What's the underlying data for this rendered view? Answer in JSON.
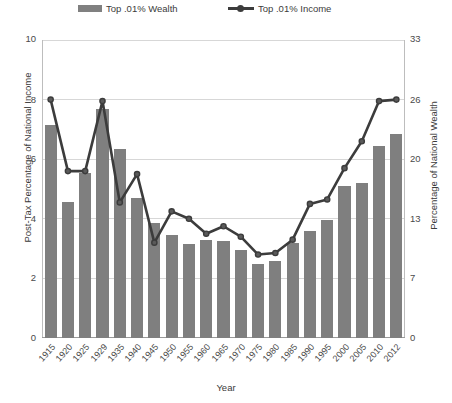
{
  "legend": {
    "entries": [
      {
        "label": "Top .01% Wealth",
        "marker": "bar-swatch",
        "color": "#808080"
      },
      {
        "label": "Top .01% Income",
        "marker": "line-marker",
        "color": "#3c3c3c"
      }
    ]
  },
  "axes": {
    "left_title": "Post-Tax Percentage of National Income",
    "right_title": "Percentage of National Wealth",
    "x_title": "Year",
    "left_ticks": [
      "0",
      "2",
      "4",
      "6",
      "8",
      "10"
    ],
    "right_ticks": [
      "0",
      "7",
      "13",
      "20",
      "26",
      "33"
    ]
  },
  "chart_data": {
    "type": "bar",
    "title": "",
    "xlabel": "Year",
    "ylabel": "Post-Tax Percentage of National Income",
    "y2label": "Percentage of National Wealth",
    "ylim": [
      0,
      10
    ],
    "y2lim": [
      0,
      33
    ],
    "yticks": [
      0,
      2,
      4,
      6,
      8,
      10
    ],
    "y2ticks": [
      0,
      7,
      13,
      20,
      26,
      33
    ],
    "grid": true,
    "legend_position": "top",
    "categories": [
      "1915",
      "1920",
      "1925",
      "1929",
      "1935",
      "1940",
      "1945",
      "1950",
      "1955",
      "1960",
      "1965",
      "1970",
      "1975",
      "1980",
      "1985",
      "1990",
      "1995",
      "2000",
      "2005",
      "2010",
      "2012"
    ],
    "series": [
      {
        "name": "Top .01% Wealth",
        "type": "bar",
        "axis": "right",
        "color": "#7f7f7f",
        "values_left_scale": [
          7.15,
          4.55,
          5.55,
          7.7,
          6.35,
          4.7,
          3.85,
          3.45,
          3.15,
          3.3,
          3.25,
          2.95,
          2.5,
          2.6,
          3.2,
          3.6,
          3.95,
          5.1,
          5.2,
          6.45,
          6.85
        ],
        "values": [
          23.6,
          15.0,
          18.3,
          25.4,
          21.0,
          15.5,
          12.7,
          11.4,
          10.4,
          10.9,
          10.7,
          9.7,
          8.3,
          8.6,
          10.6,
          11.9,
          13.0,
          16.8,
          17.2,
          21.3,
          22.6
        ]
      },
      {
        "name": "Top .01% Income",
        "type": "line",
        "axis": "left",
        "color": "#3c3c3c",
        "values": [
          8.0,
          5.6,
          5.6,
          7.95,
          4.55,
          5.5,
          3.2,
          4.25,
          4.0,
          3.5,
          3.75,
          3.4,
          2.8,
          2.85,
          3.3,
          4.5,
          4.65,
          5.7,
          6.6,
          7.95,
          8.0
        ]
      }
    ]
  }
}
